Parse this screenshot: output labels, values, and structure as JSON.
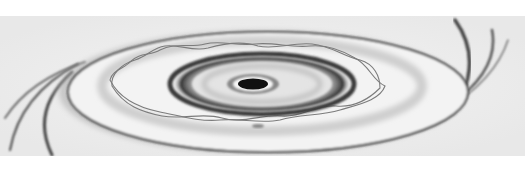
{
  "image": {
    "subject": "pencil sketch of concentric elliptical rings around a dark center with braided strands",
    "alt": "Pencil drawing of a spiral disk with dark central core, concentric rings and a braided double-helix strand",
    "style": "graphite sketch",
    "colors": {
      "paper": "#f2f2f2",
      "background": "#ffffff",
      "dark": "#141414",
      "mid": "#5a5a5a",
      "light": "#bdbdbd"
    }
  }
}
